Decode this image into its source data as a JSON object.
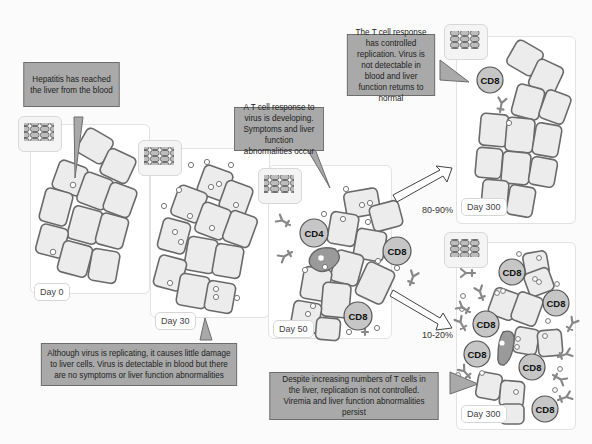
{
  "callouts": {
    "day0": "Hepatitis has reached the liver from the blood",
    "day30": "Although virus is replicating, it causes little damage to liver cells. Virus is detectable in blood but there are no symptoms or liver function abnormalities",
    "day50": "A T cell response to virus is developing. Symptoms and liver function abnormalities occur",
    "resolved": "The T cell response has controlled replication. Virus is not detectable in blood and liver function returns to normal",
    "chronic": "Despite increasing numbers of T cells in the liver, replication is not controlled. Viremia and liver function abnormalities persist"
  },
  "panels": {
    "day0": {
      "label": "Day 0"
    },
    "day30": {
      "label": "Day 30"
    },
    "day50": {
      "label": "Day 50"
    },
    "resolved": {
      "label": "Day 300"
    },
    "chronic": {
      "label": "Day 300"
    }
  },
  "arrows": {
    "resolved_pct": "80-90%",
    "chronic_pct": "10-20%"
  },
  "cell_labels": {
    "cd4": "CD4",
    "cd8": "CD8"
  },
  "colors": {
    "callout_fill": "#a9a9a9",
    "cell_fill": "#ececec",
    "tcell_fill": "#c6c6c6",
    "infected_cell": "#9a9a9a"
  }
}
